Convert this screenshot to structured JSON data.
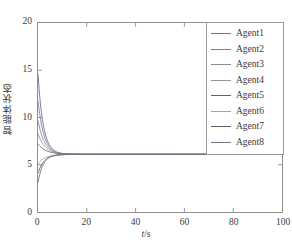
{
  "chart_data": {
    "type": "line",
    "title": "",
    "xlabel": "t/s",
    "ylabel": "智能体状态",
    "xlim": [
      0,
      100
    ],
    "ylim": [
      0,
      20
    ],
    "xticks": [
      0,
      20,
      40,
      60,
      80,
      100
    ],
    "yticks": [
      0,
      5,
      10,
      15,
      20
    ],
    "xtick_labels": [
      "0",
      "20",
      "40",
      "60",
      "80",
      "100"
    ],
    "ytick_labels": [
      "0",
      "5",
      "10",
      "15",
      "20"
    ],
    "grid": false,
    "legend_position": "upper right",
    "consensus_value": 6.1,
    "series": [
      {
        "name": "Agent1",
        "color": "#6b6fa8",
        "initial": 14.6,
        "final": 6.1,
        "rate": 0.46
      },
      {
        "name": "Agent2",
        "color": "#7b7f9e",
        "initial": 11.8,
        "final": 6.1,
        "rate": 0.42
      },
      {
        "name": "Agent3",
        "color": "#8a8a95",
        "initial": 9.7,
        "final": 6.1,
        "rate": 0.38
      },
      {
        "name": "Agent4",
        "color": "#9b9590",
        "initial": 8.3,
        "final": 6.1,
        "rate": 0.34
      },
      {
        "name": "Agent5",
        "color": "#5f6470",
        "initial": 7.2,
        "final": 6.1,
        "rate": 0.3
      },
      {
        "name": "Agent6",
        "color": "#a3a3a3",
        "initial": 5.1,
        "final": 6.1,
        "rate": 0.33
      },
      {
        "name": "Agent7",
        "color": "#5a5f6b",
        "initial": 4.1,
        "final": 6.1,
        "rate": 0.4
      },
      {
        "name": "Agent8",
        "color": "#6f7384",
        "initial": 3.1,
        "final": 6.1,
        "rate": 0.48
      }
    ]
  },
  "legend": {
    "entries": [
      {
        "label": "Agent1"
      },
      {
        "label": "Agent2"
      },
      {
        "label": "Agent3"
      },
      {
        "label": "Agent4"
      },
      {
        "label": "Agent5"
      },
      {
        "label": "Agent6"
      },
      {
        "label": "Agent7"
      },
      {
        "label": "Agent8"
      }
    ]
  },
  "axes": {
    "x_title": "t/s",
    "x_title_italic_part": "t",
    "x_title_rest": "/s",
    "y_title": "智能体状态"
  },
  "colors": {
    "axis": "#8f8f8f",
    "tick_text": "#3b3b3b",
    "legend_border": "#9a9a9a",
    "background": "#ffffff"
  }
}
